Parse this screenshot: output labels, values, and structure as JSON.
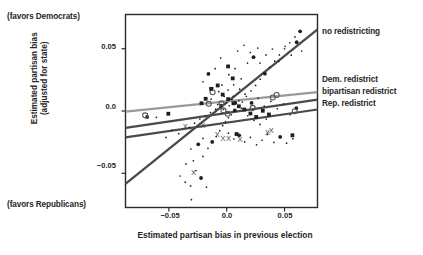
{
  "chart_data": {
    "type": "scatter",
    "title": "",
    "xlabel": "Estimated partisan bias in previous election",
    "ylabel": "Estimated partisan bias\n(adjusted for state)",
    "ylabel_line1": "Estimated partisan bias",
    "ylabel_line2": "(adjusted for state)",
    "xlim": [
      -0.0875,
      0.0785
    ],
    "ylim": [
      -0.0775,
      0.0775
    ],
    "xticks": [
      -0.05,
      0.0,
      0.05
    ],
    "xtick_labels": [
      "−0.05",
      "0.0",
      "0.05"
    ],
    "yticks": [
      0.05,
      0.0,
      -0.05
    ],
    "ytick_labels": [
      "0.05",
      "0.0",
      "−0.05"
    ],
    "grid": false,
    "legend_position": "right-outside",
    "direction_annotations": {
      "top": "(favors Democrats)",
      "bottom": "(favors Republicans)"
    },
    "series": [
      {
        "name": "no redistricting",
        "marker": "dot",
        "label": "no redistricting",
        "fit_line": {
          "x0": -0.0875,
          "y0": -0.0585,
          "x1": 0.0785,
          "y1": 0.0655,
          "color": "#4a4a4a",
          "width": 2.2
        },
        "points": [
          [
            -0.0246,
            -0.0268
          ],
          [
            -0.0205,
            -0.022
          ],
          [
            -0.031,
            -0.0305
          ],
          [
            -0.0352,
            -0.0425
          ],
          [
            -0.0288,
            -0.04
          ],
          [
            -0.0205,
            -0.0365
          ],
          [
            -0.0162,
            -0.03
          ],
          [
            -0.0125,
            -0.0248
          ],
          [
            -0.009,
            -0.0205
          ],
          [
            -0.006,
            -0.0158
          ],
          [
            -0.0035,
            -0.0118
          ],
          [
            -0.001,
            -0.0085
          ],
          [
            0.0015,
            -0.0055
          ],
          [
            0.004,
            -0.003
          ],
          [
            0.007,
            0.0005
          ],
          [
            0.01,
            0.0035
          ],
          [
            0.0135,
            0.0072
          ],
          [
            0.017,
            0.0118
          ],
          [
            0.021,
            0.0162
          ],
          [
            0.025,
            0.0205
          ],
          [
            0.029,
            0.0255
          ],
          [
            0.033,
            0.03
          ],
          [
            0.0372,
            0.035
          ],
          [
            0.0415,
            0.04
          ],
          [
            0.0455,
            0.045
          ],
          [
            0.05,
            0.05
          ],
          [
            0.0545,
            0.0548
          ],
          [
            0.059,
            0.0595
          ],
          [
            0.0635,
            0.064
          ],
          [
            -0.012,
            0.0185
          ],
          [
            -0.0042,
            0.0208
          ],
          [
            0.0018,
            0.0292
          ],
          [
            0.0072,
            0.034
          ],
          [
            0.0125,
            0.0258
          ],
          [
            0.018,
            0.0385
          ],
          [
            0.0232,
            0.0432
          ],
          [
            0.0288,
            0.0385
          ],
          [
            0.034,
            0.045
          ],
          [
            0.0395,
            0.0498
          ],
          [
            0.045,
            0.0398
          ],
          [
            0.0505,
            0.052
          ],
          [
            0.0558,
            0.0448
          ],
          [
            0.0605,
            0.0552
          ],
          [
            0.0648,
            0.0482
          ],
          [
            0.0095,
            0.0482
          ],
          [
            0.015,
            0.0528
          ],
          [
            0.0205,
            0.047
          ],
          [
            0.0268,
            0.0505
          ],
          [
            -0.0205,
            0.0235
          ],
          [
            -0.0158,
            0.0298
          ],
          [
            -0.01,
            0.034
          ],
          [
            -0.0052,
            0.0425
          ],
          [
            0.0012,
            0.0168
          ],
          [
            0.0058,
            0.0118
          ],
          [
            0.0105,
            0.0082
          ],
          [
            0.0158,
            0.0135
          ],
          [
            0.0215,
            0.0065
          ],
          [
            0.0272,
            0.0102
          ],
          [
            0.0325,
            0.004
          ],
          [
            0.0382,
            0.0078
          ],
          [
            0.0438,
            0.0018
          ],
          [
            0.0492,
            0.0055
          ],
          [
            0.0548,
            -0.003
          ],
          [
            0.0602,
            0.0022
          ],
          [
            -0.0322,
            -0.0132
          ],
          [
            -0.0278,
            -0.0098
          ],
          [
            -0.0232,
            -0.0065
          ],
          [
            -0.0185,
            -0.004
          ],
          [
            -0.014,
            -0.0012
          ],
          [
            -0.0095,
            0.0015
          ],
          [
            -0.0048,
            0.0042
          ],
          [
            -0.0002,
            0.0068
          ],
          [
            0.0045,
            0.0092
          ],
          [
            -0.0402,
            -0.0522
          ],
          [
            -0.0358,
            -0.0572
          ],
          [
            -0.0312,
            -0.0602
          ],
          [
            -0.0265,
            -0.0478
          ],
          [
            -0.0222,
            -0.0538
          ],
          [
            -0.0175,
            -0.0612
          ],
          [
            -0.0305,
            -0.0712
          ],
          [
            -0.0415,
            -0.0182
          ],
          [
            -0.0475,
            -0.0155
          ],
          [
            -0.0525,
            -0.0212
          ],
          [
            -0.0608,
            -0.0052
          ],
          [
            -0.0688,
            -0.0048
          ],
          [
            0.006,
            0.021
          ],
          [
            0.0112,
            0.0175
          ],
          [
            -0.0022,
            0.0118
          ],
          [
            -0.0068,
            0.0155
          ],
          [
            0.0015,
            -0.0178
          ],
          [
            0.0062,
            -0.0225
          ],
          [
            0.0108,
            -0.0195
          ],
          [
            0.0155,
            -0.0248
          ],
          [
            0.0205,
            -0.0212
          ],
          [
            0.0258,
            -0.0272
          ],
          [
            0.0305,
            -0.0235
          ],
          [
            0.0352,
            -0.0188
          ],
          [
            0.0408,
            -0.0252
          ],
          [
            0.0462,
            -0.0208
          ],
          [
            0.0518,
            -0.0258
          ],
          [
            0.0572,
            -0.0222
          ],
          [
            -0.0135,
            0.0095
          ],
          [
            -0.0078,
            0.0052
          ],
          [
            -0.0028,
            0.0012
          ],
          [
            0.0022,
            0.0042
          ],
          [
            0.0075,
            0.0065
          ],
          [
            0.0128,
            0.0022
          ],
          [
            0.0182,
            -0.0038
          ],
          [
            0.0235,
            -0.0075
          ],
          [
            0.0288,
            -0.0108
          ],
          [
            0.0342,
            -0.0065
          ]
        ]
      },
      {
        "name": "Dem. redistrict",
        "marker": "O",
        "label": "Dem. redistrict",
        "fit_line": {
          "x0": -0.0875,
          "y0": -0.0005,
          "x1": 0.0785,
          "y1": 0.0152,
          "color": "#9a9a9a",
          "width": 2.2
        },
        "points": [
          [
            -0.0705,
            -0.0035
          ],
          [
            -0.0122,
            0.015
          ],
          [
            -0.0045,
            0.0062
          ],
          [
            -0.0028,
            0.0005
          ],
          [
            0.0008,
            -0.0022
          ],
          [
            0.0398,
            0.0108
          ],
          [
            0.0432,
            0.0128
          ],
          [
            0.0588,
            -0.0002
          ],
          [
            -0.0155,
            0.0058
          ],
          [
            0.0225,
            0.0025
          ]
        ]
      },
      {
        "name": "bipartisan redistrict",
        "marker": "square",
        "label": "bipartisan redistrict",
        "fit_line": {
          "x0": -0.0875,
          "y0": -0.0135,
          "x1": 0.0785,
          "y1": 0.0092,
          "color": "#4a4a4a",
          "width": 2.2
        },
        "points": [
          [
            -0.0505,
            -0.0022
          ],
          [
            -0.0135,
            0.0178
          ],
          [
            -0.0078,
            0.0205
          ],
          [
            -0.0035,
            0.0132
          ],
          [
            0.0012,
            0.0095
          ],
          [
            0.0058,
            0.0062
          ],
          [
            0.0105,
            0.0038
          ],
          [
            0.0152,
            0.0012
          ],
          [
            0.0205,
            -0.002
          ],
          [
            0.0255,
            -0.0048
          ],
          [
            0.0312,
            0.0002
          ],
          [
            0.0365,
            -0.0028
          ],
          [
            -0.0182,
            0.0098
          ],
          [
            0.0052,
            0.0262
          ],
          [
            0.0568,
            -0.0195
          ],
          [
            0.0085,
            -0.0185
          ],
          [
            -0.0218,
            0.0062
          ],
          [
            0.0012,
            0.0358
          ]
        ]
      },
      {
        "name": "Rep. redistrict",
        "marker": "X",
        "label": "Rep. redistrict",
        "fit_line": {
          "x0": -0.0875,
          "y0": -0.0212,
          "x1": 0.0785,
          "y1": 0.0012,
          "color": "#4a4a4a",
          "width": 2.2
        },
        "points": [
          [
            -0.0358,
            -0.0125
          ],
          [
            -0.0082,
            -0.019
          ],
          [
            -0.0032,
            -0.0218
          ],
          [
            0.0015,
            -0.0222
          ],
          [
            0.0385,
            -0.0158
          ],
          [
            -0.0288,
            -0.0492
          ],
          [
            -0.0205,
            -0.0112
          ],
          [
            0.0352,
            -0.0168
          ],
          [
            0.0115,
            -0.0228
          ]
        ]
      }
    ]
  }
}
